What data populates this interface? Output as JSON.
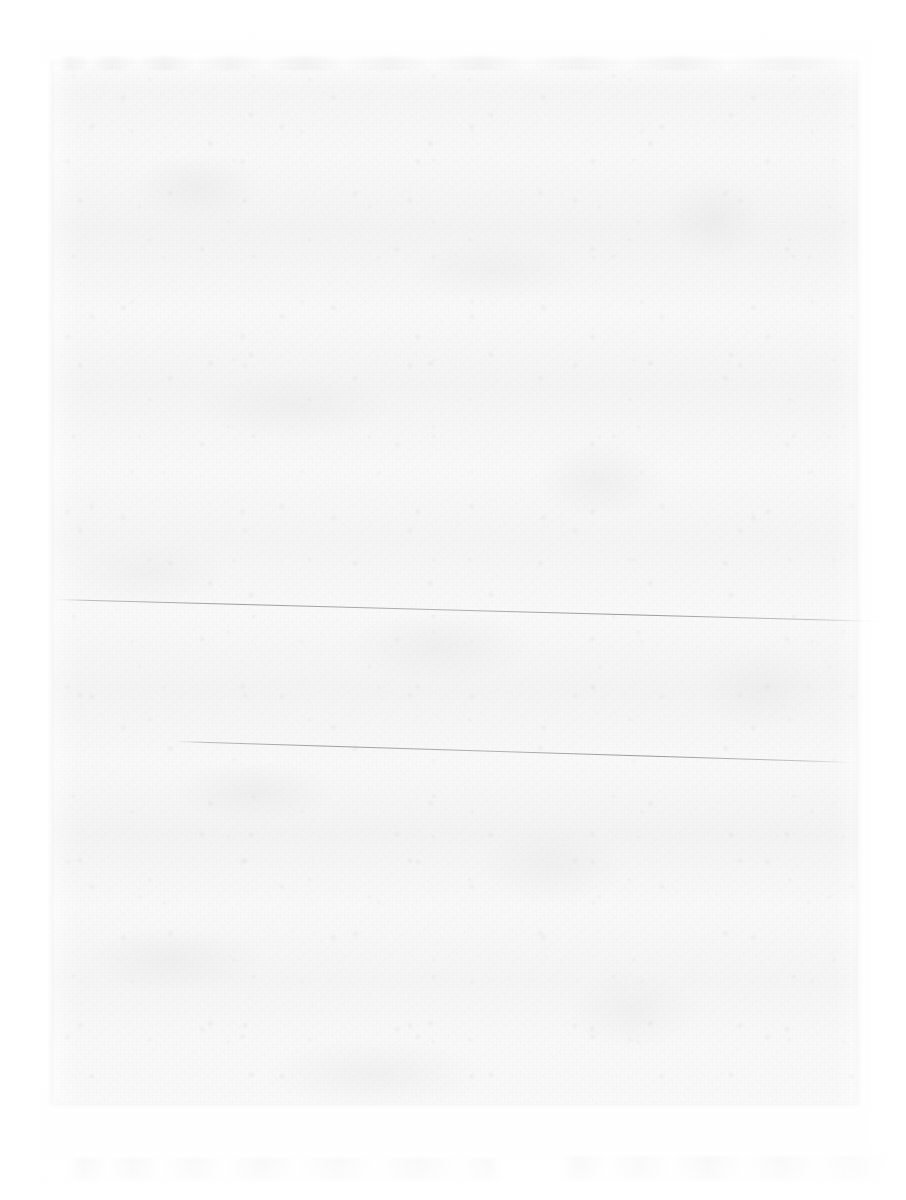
{
  "document": {
    "kind": "scanned-page",
    "title": "",
    "visible_text": "",
    "legible_text_present": false,
    "description": "Blank, heavily faded scan of a sheet of paper. No legible text, headings, figures or captions are rendered in the pixels.",
    "page_number": "",
    "body_paragraphs": []
  },
  "canvas": {
    "width_px": 906,
    "height_px": 1200,
    "background_color": "#ffffff"
  },
  "paper": {
    "label": "paper-sheet",
    "left_px": 52,
    "top_px": 62,
    "width_px": 806,
    "height_px": 1043,
    "tone_color": "#f9f9f9",
    "grain_color": "#d4d4d8",
    "mottle_color": "#d6d6da"
  },
  "artifacts": {
    "creases": [
      {
        "name": "upper-fold-line",
        "start_x_px": 55,
        "start_y_px": 599,
        "end_x_px": 883,
        "end_y_px": 621,
        "color": "#80808a"
      },
      {
        "name": "lower-fold-line",
        "start_x_px": 176,
        "start_y_px": 741,
        "end_x_px": 856,
        "end_y_px": 762,
        "color": "#7e7e85"
      }
    ],
    "ghost_text_rows": [
      {
        "name": "top-edge-ghost-row",
        "top_px": 56,
        "left_px": 60,
        "width_px": 800,
        "color": "#c4c4ca"
      },
      {
        "name": "bottom-left-ghost-row",
        "top_px": 1158,
        "left_px": 70,
        "width_px": 430,
        "color": "#c6c6cc"
      },
      {
        "name": "bottom-right-ghost-row",
        "top_px": 1156,
        "left_px": 560,
        "width_px": 330,
        "color": "#c5c5cb"
      }
    ],
    "edge_shadow_color": "#dedee2"
  }
}
